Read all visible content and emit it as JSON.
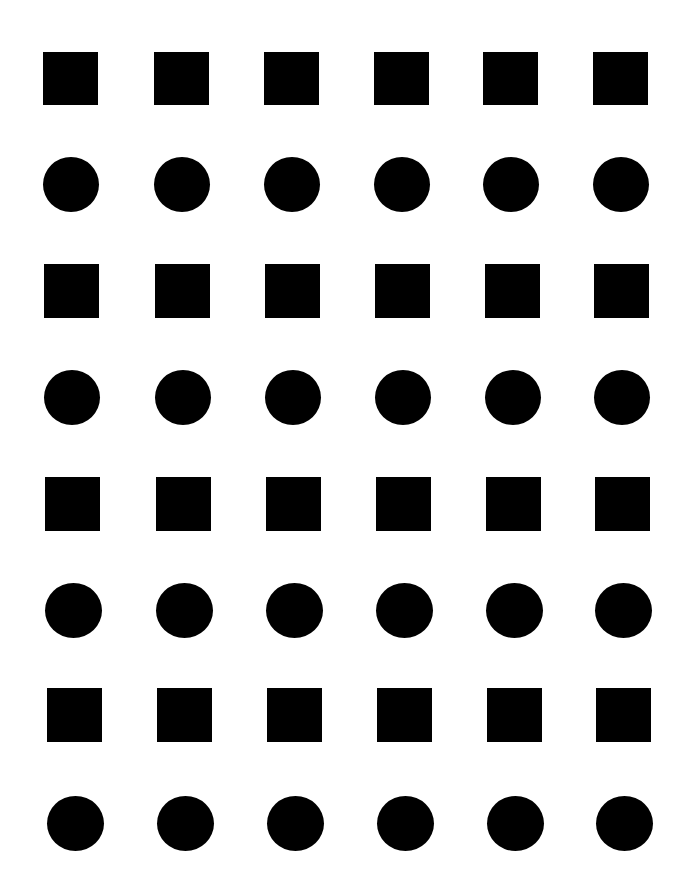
{
  "figure": {
    "width": 683,
    "height": 881,
    "background": "#ffffff",
    "fill_color": "#000000",
    "layout": "8 rows x 6 columns, alternating rows of squares and circles starting with squares",
    "columns": 6,
    "rows": [
      {
        "shape": "square",
        "top": 52,
        "height": 53,
        "width": 55,
        "lefts": [
          43,
          154,
          264,
          374,
          483,
          593
        ]
      },
      {
        "shape": "circle",
        "top": 157,
        "height": 55,
        "width": 56,
        "lefts": [
          43,
          154,
          264,
          374,
          483,
          593
        ]
      },
      {
        "shape": "square",
        "top": 264,
        "height": 54,
        "width": 55,
        "lefts": [
          44,
          155,
          265,
          375,
          485,
          594
        ]
      },
      {
        "shape": "circle",
        "top": 370,
        "height": 55,
        "width": 56,
        "lefts": [
          44,
          155,
          265,
          375,
          485,
          594
        ]
      },
      {
        "shape": "square",
        "top": 477,
        "height": 54,
        "width": 55,
        "lefts": [
          45,
          156,
          266,
          376,
          486,
          595
        ]
      },
      {
        "shape": "circle",
        "top": 583,
        "height": 55,
        "width": 57,
        "lefts": [
          45,
          156,
          266,
          376,
          486,
          595
        ]
      },
      {
        "shape": "square",
        "top": 688,
        "height": 54,
        "width": 55,
        "lefts": [
          47,
          157,
          267,
          377,
          487,
          596
        ]
      },
      {
        "shape": "circle",
        "top": 796,
        "height": 55,
        "width": 57,
        "lefts": [
          47,
          157,
          267,
          377,
          487,
          596
        ]
      }
    ]
  }
}
